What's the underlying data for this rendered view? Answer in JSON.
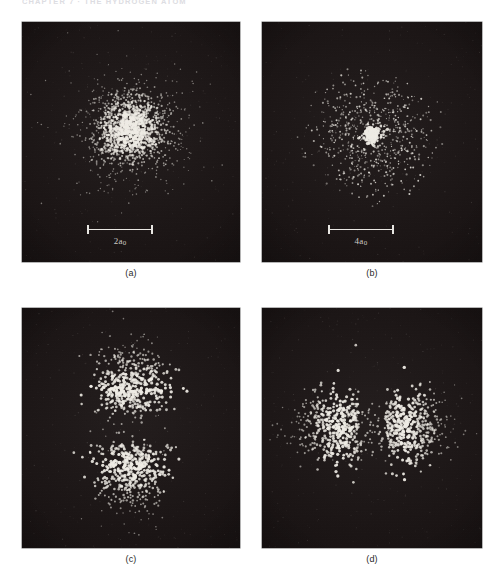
{
  "header": {
    "running_head": "CHAPTER 7 · THE HYDROGEN ATOM"
  },
  "figure": {
    "panels": [
      {
        "id": "panel-a",
        "caption": "(a)",
        "scalebar": {
          "label_main": "2",
          "label_symbol": "a",
          "label_sub": "0"
        },
        "has_scalebar": true
      },
      {
        "id": "panel-b",
        "caption": "(b)",
        "scalebar": {
          "label_main": "4",
          "label_symbol": "a",
          "label_sub": "0"
        },
        "has_scalebar": true
      },
      {
        "id": "panel-c",
        "caption": "(c)",
        "scalebar": null,
        "has_scalebar": false
      },
      {
        "id": "panel-d",
        "caption": "(d)",
        "scalebar": null,
        "has_scalebar": false
      }
    ]
  },
  "chart_data": {
    "type": "scatter",
    "xlabel": "",
    "ylabel": "",
    "grid": false,
    "legend": "none",
    "background_color": "#191313",
    "dot_color": "#f2efe8",
    "page_background": "#ffffff",
    "panel_layout": "2x2",
    "subplots": [
      {
        "id": "a",
        "caption": "(a)",
        "distribution": "spherical-1s",
        "description": "Single dense spherically symmetric cloud centred in the frame, brightest at the nucleus and fading smoothly outward.",
        "n_dots": 1500,
        "center_frac": [
          0.5,
          0.45
        ],
        "radial_scale_frac": 0.105,
        "scalebar": {
          "text": "2a₀",
          "value": 2,
          "unit": "a₀",
          "length_frac": 0.3,
          "x_frac": 0.3,
          "y_frac": 0.845
        }
      },
      {
        "id": "b",
        "caption": "(b)",
        "distribution": "spherical-2s",
        "description": "Small intensely bright inner core surrounded by a sparse, much larger diffuse outer shell with a low-density node between them.",
        "n_dots": 900,
        "center_frac": [
          0.5,
          0.47
        ],
        "inner_scale_frac": 0.035,
        "outer_scale_frac": 0.22,
        "inner_fraction": 0.22,
        "scalebar": {
          "text": "4a₀",
          "value": 4,
          "unit": "a₀",
          "length_frac": 0.3,
          "x_frac": 0.3,
          "y_frac": 0.845
        }
      },
      {
        "id": "c",
        "caption": "(c)",
        "distribution": "dumbbell-vertical-2pz",
        "description": "Two lobes stacked vertically, separated by a horizontal nodal plane through the nucleus.",
        "n_dots": 1100,
        "center_frac": [
          0.5,
          0.5
        ],
        "lobe_offset_frac": 0.16,
        "lobe_scale_frac": 0.105,
        "scalebar": null
      },
      {
        "id": "d",
        "caption": "(d)",
        "distribution": "dumbbell-horizontal-2px",
        "description": "Two lobes placed side by side horizontally, separated by a vertical nodal plane through the nucleus.",
        "n_dots": 1100,
        "center_frac": [
          0.5,
          0.5
        ],
        "lobe_offset_frac": 0.145,
        "lobe_scale_frac": 0.1,
        "scalebar": null
      }
    ]
  }
}
